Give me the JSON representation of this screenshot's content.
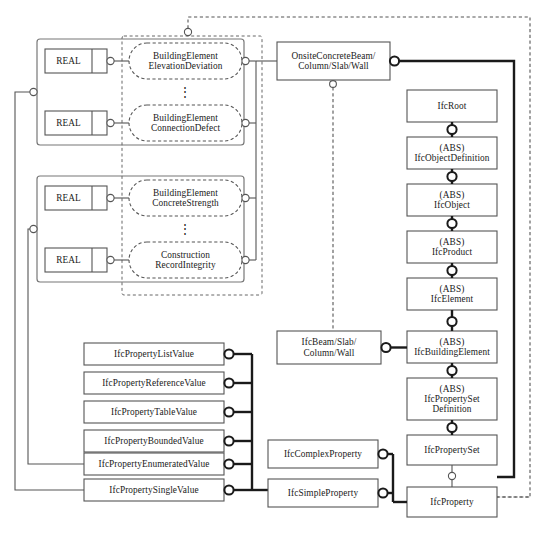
{
  "diagram": {
    "type": "EXPRESS-G entity relationship diagram"
  },
  "attribute_boxes": [
    {
      "id": "real-1",
      "label": "REAL"
    },
    {
      "id": "real-2",
      "label": "REAL"
    },
    {
      "id": "real-3",
      "label": "REAL"
    },
    {
      "id": "real-4",
      "label": "REAL"
    }
  ],
  "property_ellipses": [
    {
      "id": "ell-1",
      "line1": "BuildingElement",
      "line2": "ElevationDeviation"
    },
    {
      "id": "ell-2",
      "line1": "BuildingElement",
      "line2": "ConnectionDefect"
    },
    {
      "id": "ell-3",
      "line1": "BuildingElement",
      "line2": "ConcreteStrength"
    },
    {
      "id": "ell-4",
      "line1": "Construction",
      "line2": "RecordIntegrity"
    }
  ],
  "ellipsis_marks": [
    {
      "id": "dots-1",
      "glyph": "⋮"
    },
    {
      "id": "dots-2",
      "glyph": "⋮"
    }
  ],
  "onsite_entity": {
    "line1": "OnsiteConcreteBeam/",
    "line2": "Column/Slab/Wall"
  },
  "ifc_beam_entity": {
    "line1": "IfcBeam/Slab/",
    "line2": "Column/Wall"
  },
  "ifc_hierarchy": [
    {
      "id": "ifc-root",
      "abs": "",
      "name": "IfcRoot"
    },
    {
      "id": "ifc-object-definition",
      "abs": "(ABS)",
      "name": "IfcObjectDefinition"
    },
    {
      "id": "ifc-object",
      "abs": "(ABS)",
      "name": "IfcObject"
    },
    {
      "id": "ifc-product",
      "abs": "(ABS)",
      "name": "IfcProduct"
    },
    {
      "id": "ifc-element",
      "abs": "(ABS)",
      "name": "IfcElement"
    },
    {
      "id": "ifc-building-element",
      "abs": "(ABS)",
      "name": "IfcBuildingElement"
    },
    {
      "id": "ifc-property-set-definition",
      "abs": "(ABS)",
      "name": "IfcPropertySet",
      "name2": "Definition"
    },
    {
      "id": "ifc-property-set",
      "abs": "",
      "name": "IfcPropertySet"
    },
    {
      "id": "ifc-property",
      "abs": "",
      "name": "IfcProperty"
    }
  ],
  "property_value_boxes": [
    {
      "id": "ifc-property-list-value",
      "label": "IfcPropertyListValue"
    },
    {
      "id": "ifc-property-reference-value",
      "label": "IfcPropertyReferenceValue"
    },
    {
      "id": "ifc-property-table-value",
      "label": "IfcPropertyTableValue"
    },
    {
      "id": "ifc-property-bounded-value",
      "label": "IfcPropertyBoundedValue"
    },
    {
      "id": "ifc-property-enumerated-value",
      "label": "IfcPropertyEnumeratedValue"
    },
    {
      "id": "ifc-property-single-value",
      "label": "IfcPropertySingleValue"
    }
  ],
  "property_kind_boxes": [
    {
      "id": "ifc-complex-property",
      "label": "IfcComplexProperty"
    },
    {
      "id": "ifc-simple-property",
      "label": "IfcSimpleProperty"
    }
  ],
  "colors": {
    "stroke": "#4d4d4d",
    "stroke_dark": "#1a1a1a",
    "text": "#1a1a1a",
    "background": "#ffffff"
  }
}
